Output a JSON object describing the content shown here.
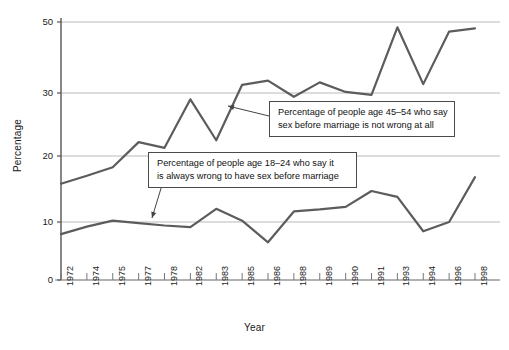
{
  "figure": {
    "background": "#ffffff",
    "line_color": "#5c5c5c",
    "grid_color": "#b9b9b9",
    "axis_color": "#6e6e6e"
  },
  "axes": {
    "y_title": "Percentage",
    "x_title": "Year",
    "y_ticks": [
      "0",
      "10",
      "20",
      "30",
      "50"
    ],
    "x_ticks": [
      "1972",
      "1974",
      "1975",
      "1977",
      "1978",
      "1982",
      "1983",
      "1985",
      "1986",
      "1988",
      "1989",
      "1990",
      "1991",
      "1993",
      "1994",
      "1996",
      "1998"
    ]
  },
  "annotations": {
    "callout_45_54": {
      "line1": "Percentage of people age 45–54 who say",
      "line2": "sex before marriage is not wrong at all"
    },
    "callout_18_24": {
      "line1": "Percentage of people age 18–24 who say it",
      "line2": "is always wrong to have sex before marriage"
    }
  },
  "chart_data": {
    "type": "line",
    "title": "",
    "xlabel": "Year",
    "ylabel": "Percentage",
    "xlim": [
      "1972",
      "1998"
    ],
    "ylim": [
      0,
      50
    ],
    "y_tick_values": [
      0,
      10,
      20,
      30,
      50
    ],
    "grid": "horizontal",
    "legend": "annotated-callouts",
    "categories": [
      "1972",
      "1974",
      "1975",
      "1977",
      "1978",
      "1982",
      "1983",
      "1985",
      "1986",
      "1988",
      "1989",
      "1990",
      "1991",
      "1993",
      "1994",
      "1996",
      "1998"
    ],
    "series": [
      {
        "name": "Percentage of people age 45–54 who say sex before marriage is not wrong at all",
        "color": "#5c5c5c",
        "values": [
          15.8,
          17.0,
          18.3,
          22.2,
          21.3,
          29.0,
          22.5,
          32.3,
          33.5,
          29.4,
          33.0,
          30.3,
          29.7,
          48.5,
          32.5,
          47.3,
          48.2
        ]
      },
      {
        "name": "Percentage of people age 18–24 who say it is always wrong to have sex before marriage",
        "color": "#5c5c5c",
        "values": [
          7.9,
          9.2,
          10.2,
          9.8,
          9.4,
          9.1,
          12.0,
          10.2,
          6.5,
          11.6,
          11.9,
          12.3,
          14.7,
          13.8,
          8.4,
          10.0,
          16.8
        ]
      }
    ],
    "annotation_arrows": [
      {
        "for": "45-54",
        "from": [
          269,
          116
        ],
        "to": [
          228,
          106
        ]
      },
      {
        "for": "18-24",
        "from": [
          172,
          152
        ],
        "to": [
          152,
          218
        ]
      }
    ]
  }
}
